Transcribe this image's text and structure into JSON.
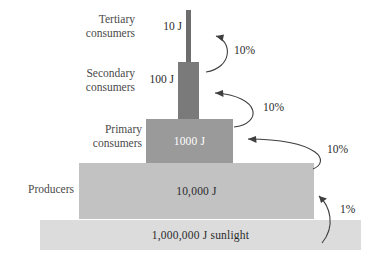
{
  "diagram": {
    "tiers": [
      {
        "id": "tertiary",
        "name": "Tertiary\nconsumers",
        "energy": "10 J",
        "energy_joules": 10,
        "label_placement": "outside-left",
        "bar_color": "#6d6d6d"
      },
      {
        "id": "secondary",
        "name": "Secondary\nconsumers",
        "energy": "100 J",
        "energy_joules": 100,
        "label_placement": "outside-left",
        "bar_color": "#7a7a7a"
      },
      {
        "id": "primary",
        "name": "Primary\nconsumers",
        "energy": "1000 J",
        "energy_joules": 1000,
        "label_placement": "inside",
        "bar_color": "#9a9a9a"
      },
      {
        "id": "producers",
        "name": "Producers",
        "energy": "10,000 J",
        "energy_joules": 10000,
        "label_placement": "inside",
        "bar_color": "#c2c2c2"
      },
      {
        "id": "sunlight",
        "name": "",
        "energy": "1,000,000 J sunlight",
        "energy_joules": 1000000,
        "label_placement": "inside",
        "bar_color": "#dcdcdc"
      }
    ],
    "transfers": [
      {
        "id": "t1",
        "from": "secondary",
        "to": "tertiary",
        "efficiency": "10%"
      },
      {
        "id": "t2",
        "from": "primary",
        "to": "secondary",
        "efficiency": "10%"
      },
      {
        "id": "t3",
        "from": "producers",
        "to": "primary",
        "efficiency": "10%"
      },
      {
        "id": "t4",
        "from": "sunlight",
        "to": "producers",
        "efficiency": "1%"
      }
    ],
    "colors": {
      "text": "#2b2b2b",
      "tier_name_text": "#4a4a4a",
      "inside_light_text": "#ffffff",
      "arrow": "#3f3f3f",
      "background": "#ffffff"
    }
  }
}
